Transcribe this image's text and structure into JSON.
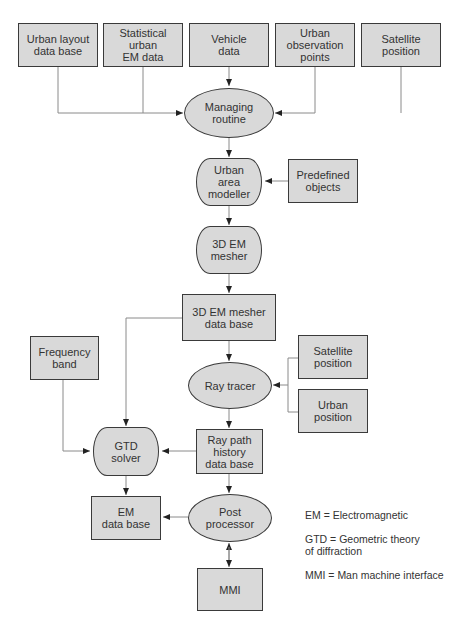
{
  "diagram": {
    "nodes": {
      "urban_layout": "Urban layout\ndata base",
      "statistical_em": "Statistical urban\nEM data",
      "vehicle": "Vehicle\ndata",
      "observation_points": "Urban\nobservation\npoints",
      "satellite_top": "Satellite\nposition",
      "managing": "Managing\nroutine",
      "area_modeller": "Urban\narea\nmodeller",
      "predefined": "Predefined\nobjects",
      "mesher": "3D EM\nmesher",
      "mesher_db": "3D EM mesher\ndata base",
      "frequency": "Frequency\nband",
      "ray_tracer": "Ray tracer",
      "satellite_right": "Satellite\nposition",
      "urban_position": "Urban\nposition",
      "gtd": "GTD\nsolver",
      "ray_path_db": "Ray path\nhistory\ndata base",
      "em_db": "EM\ndata base",
      "post": "Post\nprocessor",
      "mmi": "MMI"
    },
    "legend": [
      "EM = Electromagnetic",
      "GTD = Geometric theory\nof diffraction",
      "MMI = Man machine interface"
    ],
    "colors": {
      "fill": "#d9d9d9",
      "stroke": "#3a3a3a",
      "line": "#8a8a8a"
    }
  }
}
